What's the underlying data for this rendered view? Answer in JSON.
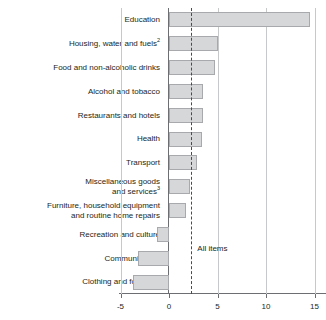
{
  "chart_data": {
    "type": "bar",
    "orientation": "horizontal",
    "title": "",
    "xlabel": "",
    "ylabel": "",
    "xlim": [
      -5,
      15
    ],
    "xticks": [
      -5,
      0,
      5,
      10,
      15
    ],
    "xtick_labels": [
      "-5",
      "0",
      "5",
      "10",
      "15"
    ],
    "grid": true,
    "legend": false,
    "categories": [
      "Education",
      "Housing, water and fuels",
      "Food and non-alcoholic drinks",
      "Alcohol and tobacco",
      "Restaurants and hotels",
      "Health",
      "Transport",
      "Miscellaneous goods and services",
      "Furniture, household equipment and routine home repairs",
      "Recreation and culture",
      "Communication",
      "Clothing and footwear"
    ],
    "values": [
      14.5,
      5.0,
      4.7,
      3.5,
      3.5,
      3.4,
      2.9,
      2.2,
      1.8,
      -1.2,
      -3.2,
      -3.7
    ],
    "annotations": [
      {
        "label": "All items",
        "value": 2.3,
        "style": "dashed-vertical-line"
      }
    ],
    "series_color": "#d6d7d8",
    "series_border_color": "#a8a9ad",
    "axis_color": "#6d6e71",
    "gridline_color": "#c7c8ca"
  },
  "axis": {
    "ticks": [
      {
        "label": "-5",
        "value": -5
      },
      {
        "label": "0",
        "value": 0
      },
      {
        "label": "5",
        "value": 5
      },
      {
        "label": "10",
        "value": 10
      },
      {
        "label": "15",
        "value": 15
      }
    ]
  },
  "category_labels": [
    {
      "line1": "Education",
      "line2": "",
      "sup": ""
    },
    {
      "line1": "Housing, water and fuels",
      "line2": "",
      "sup": "2"
    },
    {
      "line1": "Food and non-alcoholic drinks",
      "line2": "",
      "sup": ""
    },
    {
      "line1": "Alcohol and tobacco",
      "line2": "",
      "sup": ""
    },
    {
      "line1": "Restaurants and hotels",
      "line2": "",
      "sup": ""
    },
    {
      "line1": "Health",
      "line2": "",
      "sup": ""
    },
    {
      "line1": "Transport",
      "line2": "",
      "sup": ""
    },
    {
      "line1": "Miscellaneous goods",
      "line2": "and services",
      "sup": "3"
    },
    {
      "line1": "Furniture, household equipment",
      "line2": "and routine home repairs",
      "sup": ""
    },
    {
      "line1": "Recreation and culture",
      "line2": "",
      "sup": ""
    },
    {
      "line1": "Communication",
      "line2": "",
      "sup": ""
    },
    {
      "line1": "Clothing and footwear",
      "line2": "",
      "sup": ""
    }
  ],
  "annotation": {
    "all_items_label": "All items"
  }
}
